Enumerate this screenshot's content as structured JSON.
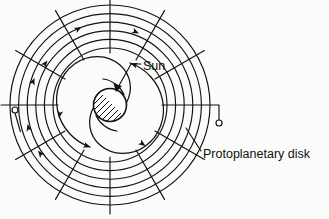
{
  "figure": {
    "domain": "diagram",
    "background_color": "#fbfbfa",
    "ink_color": "#111111",
    "width": 329,
    "height": 219
  },
  "labels": {
    "sun": "Sun",
    "disk": "Protoplanetary disk"
  },
  "geometry": {
    "center_x": 110,
    "center_y": 105,
    "sun_radius": 16.5,
    "inner_grid_radius": 57,
    "outer_grid_radius": 100,
    "ring_count": 6,
    "spoke_count": 12,
    "spoke_overshoot": 9,
    "spiral_arm_count": 2,
    "spiral_turns": 0.72,
    "hatch_angle_deg": 45,
    "hatch_spacing": 3.2
  },
  "markers": {
    "pin_left": {
      "x": 15,
      "y": 110,
      "radius": 3
    },
    "pin_right": {
      "x": 219,
      "y": 123,
      "radius": 3
    }
  },
  "leaders": {
    "sun_leader": "horizontal segment from label left edge, then diagonal arrow down-left into the Sun disc",
    "disk_leader": "diagonal segment from label up-left into the outer ring grid"
  },
  "arrow_semantics": {
    "ring_arrows": "clockwise orbital motion of disk material",
    "spiral_arrows": "inward/outward flow along the spiral arms"
  },
  "icons": {
    "sun": "hatched-circle-icon",
    "pin": "pin-marker-icon",
    "arrow": "arrowhead-icon"
  }
}
